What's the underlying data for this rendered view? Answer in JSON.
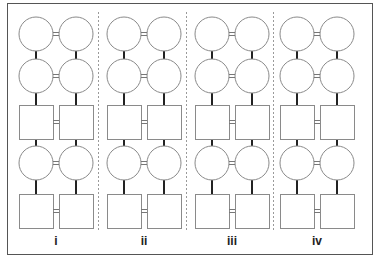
{
  "diagram": {
    "type": "pedigree-panels",
    "frame": {
      "x": 7,
      "y": 3,
      "width": 365,
      "height": 251
    },
    "colors": {
      "frame": "#555555",
      "divider": "#9a9a9a",
      "shape_stroke": "#8a8a8a",
      "descent_line": "#222222",
      "mating_line": "#777777"
    },
    "shape_size": {
      "circle_r": 17,
      "square": 34
    },
    "rows": [
      {
        "kind": "circle",
        "cy": 34
      },
      {
        "kind": "circle",
        "cy": 76
      },
      {
        "kind": "square",
        "cy": 122
      },
      {
        "kind": "circle",
        "cy": 163
      },
      {
        "kind": "square",
        "cy": 211
      }
    ],
    "dividers": [
      98,
      186,
      273
    ],
    "divider_range": {
      "y1": 12,
      "y2": 232
    },
    "panels": [
      {
        "label": "i",
        "left_cx": 36,
        "right_cx": 76,
        "label_x": 56
      },
      {
        "label": "ii",
        "left_cx": 124,
        "right_cx": 164,
        "label_x": 144
      },
      {
        "label": "iii",
        "left_cx": 212,
        "right_cx": 252,
        "label_x": 232
      },
      {
        "label": "iv",
        "left_cx": 297,
        "right_cx": 337,
        "label_x": 317
      }
    ],
    "label_y": 245
  }
}
